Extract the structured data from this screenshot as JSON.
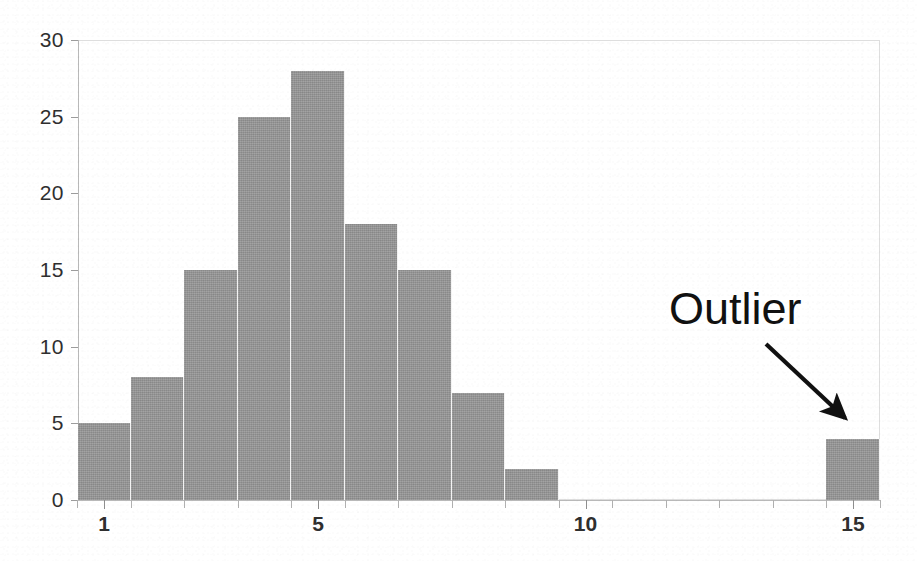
{
  "chart_data": {
    "type": "bar",
    "title": "",
    "subtitle": "",
    "xlabel": "",
    "ylabel": "",
    "xlim": [
      0.0,
      15.5
    ],
    "ylim": [
      0,
      30
    ],
    "grid": false,
    "legend": null,
    "bar_color": "#969696",
    "categories": [
      "1",
      "2",
      "3",
      "4",
      "5",
      "6",
      "7",
      "8",
      "9",
      "10",
      "11",
      "12",
      "13",
      "14",
      "15"
    ],
    "bins": [
      {
        "label": "1",
        "left": 1.0,
        "right": 2.0,
        "value": 5
      },
      {
        "label": "2",
        "left": 2.0,
        "right": 3.0,
        "value": 8
      },
      {
        "label": "3",
        "left": 3.0,
        "right": 4.0,
        "value": 15
      },
      {
        "label": "4",
        "left": 4.0,
        "right": 5.0,
        "value": 25
      },
      {
        "label": "5",
        "left": 5.0,
        "right": 6.0,
        "value": 28
      },
      {
        "label": "6",
        "left": 6.0,
        "right": 7.0,
        "value": 18
      },
      {
        "label": "7",
        "left": 7.0,
        "right": 8.0,
        "value": 15
      },
      {
        "label": "8",
        "left": 8.0,
        "right": 9.0,
        "value": 7
      },
      {
        "label": "9",
        "left": 9.0,
        "right": 10.0,
        "value": 2
      },
      {
        "label": "10",
        "left": 10.0,
        "right": 11.0,
        "value": 0
      },
      {
        "label": "11",
        "left": 11.0,
        "right": 12.0,
        "value": 0
      },
      {
        "label": "12",
        "left": 12.0,
        "right": 13.0,
        "value": 0
      },
      {
        "label": "13",
        "left": 13.0,
        "right": 14.0,
        "value": 0
      },
      {
        "label": "14",
        "left": 14.0,
        "right": 15.0,
        "value": 0
      },
      {
        "label": "15",
        "left": 15.0,
        "right": 16.0,
        "value": 4
      }
    ],
    "values": [
      5,
      8,
      15,
      25,
      28,
      18,
      15,
      7,
      2,
      0,
      0,
      0,
      0,
      0,
      4
    ],
    "yaxis": {
      "ticks": [
        0,
        5,
        10,
        15,
        20,
        25,
        30
      ],
      "tick_labels": [
        "0",
        "5",
        "10",
        "15",
        "20",
        "25",
        "30"
      ]
    },
    "xaxis": {
      "major_ticks": [
        1,
        5,
        10,
        15
      ],
      "major_tick_labels": [
        "1",
        "5",
        "10",
        "15"
      ],
      "minor_ticks": [
        2,
        3,
        4,
        6,
        7,
        8,
        9,
        11,
        12,
        13,
        14
      ]
    },
    "annotations": [
      {
        "text": "Outlier",
        "kind": "arrow-label",
        "points_to_bin": "15",
        "points_to_value": 4
      }
    ]
  }
}
